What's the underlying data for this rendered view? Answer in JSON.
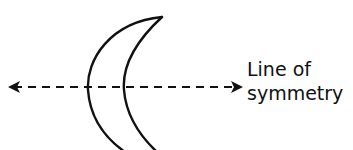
{
  "diagram": {
    "shape": "crescent",
    "line": {
      "style": "dashed",
      "direction": "horizontal",
      "arrowheads": "both"
    },
    "label": {
      "line1": "Line of",
      "line2": "symmetry"
    },
    "colors": {
      "stroke": "#111111",
      "background": "#ffffff"
    }
  }
}
